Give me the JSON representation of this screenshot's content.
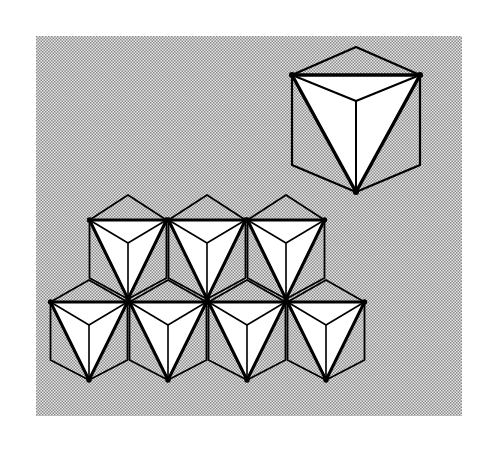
{
  "figure": {
    "background": "halftone-gray",
    "colors": {
      "paper": "#ffffff",
      "halftone_dark": "#8a8a8a",
      "halftone_light": "#e6e6e6",
      "stroke": "#000000",
      "face_fill": "#ffffff"
    },
    "single_unit": {
      "label": "isolated octahedron",
      "count": 1
    },
    "layer": {
      "label": "layer of edge-sharing octahedra",
      "rows": [
        {
          "name": "upper row",
          "count": 3
        },
        {
          "name": "lower row",
          "count": 4
        }
      ]
    }
  }
}
